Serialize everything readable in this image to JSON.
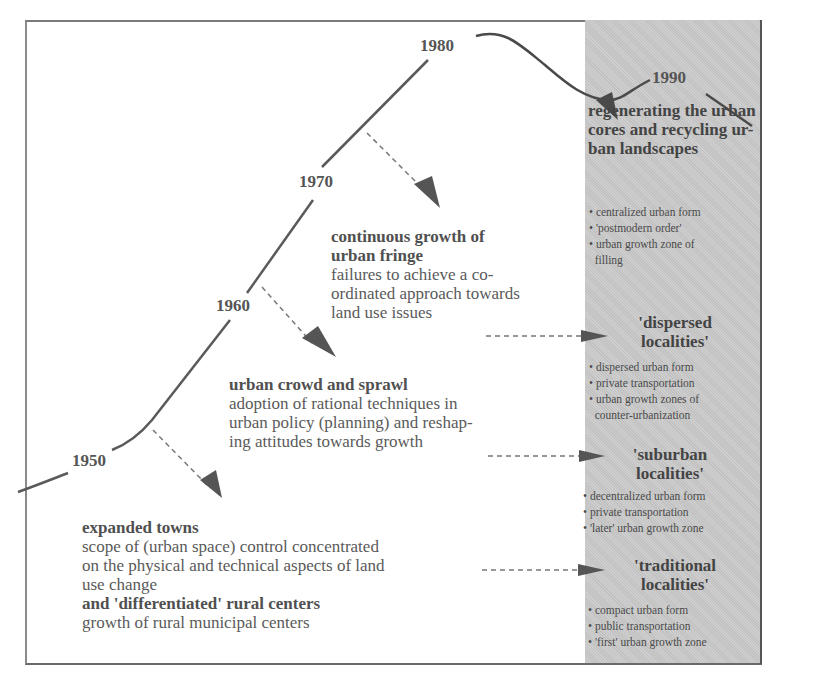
{
  "diagram": {
    "type": "timeline",
    "years": [
      "1950",
      "1960",
      "1970",
      "1980",
      "1990"
    ],
    "stages": [
      {
        "id": "1950",
        "heading": "expanded towns",
        "description": "scope of (urban space) control concentrated on the physical and technical aspects of land use change",
        "heading2": "and 'differentiated' rural centers",
        "description2": "growth of rural municipal centers",
        "lines": [
          "scope of (urban space) control concentrated",
          "on the physical and technical aspects of land",
          "use change"
        ],
        "lines2": [
          "growth of rural municipal centers"
        ]
      },
      {
        "id": "1960",
        "heading": "urban crowd and sprawl",
        "lines": [
          "adoption of rational techniques in",
          "urban policy (planning) and reshap-",
          "ing attitudes towards growth"
        ]
      },
      {
        "id": "1970",
        "heading_lines": [
          "continuous growth of",
          "urban fringe"
        ],
        "lines": [
          "failures to achieve a co-",
          "ordinated approach towards",
          "land use issues"
        ]
      }
    ],
    "panel": {
      "regenerating": {
        "title_lines": [
          "regenerating the urban",
          "cores and recycling ur-",
          "ban landscapes"
        ],
        "bullets": [
          "• centralized urban form",
          "• 'postmodern order'",
          "• urban growth zone of",
          "  filling"
        ]
      },
      "dispersed": {
        "title_lines": [
          "'dispersed",
          "localities'"
        ],
        "bullets": [
          "• dispersed urban form",
          "• private transportation",
          "• urban growth zones of",
          "  counter-urbanization"
        ]
      },
      "suburban": {
        "title_lines": [
          "'suburban",
          "localities'"
        ],
        "bullets": [
          "• decentralized urban form",
          "• private transportation",
          "• 'later' urban growth zone"
        ]
      },
      "traditional": {
        "title_lines": [
          "'traditional",
          "localities'"
        ],
        "bullets": [
          "• compact urban form",
          "• public transportation",
          "• 'first' urban growth zone"
        ]
      }
    },
    "colors": {
      "panel_bg": "#c9c9c9",
      "line": "#555555",
      "text": "#5a5a5a"
    }
  }
}
